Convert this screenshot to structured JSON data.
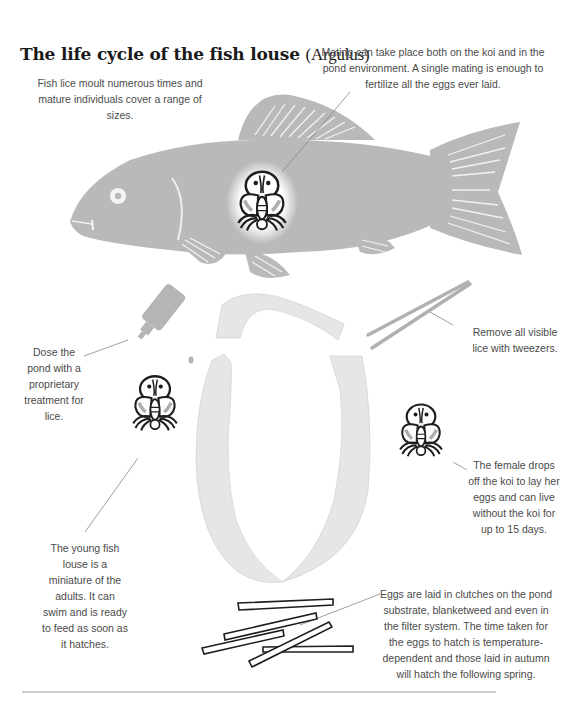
{
  "title": {
    "main": "The life cycle of the fish louse ",
    "latin": "(Argulus)"
  },
  "captions": {
    "moult": "Fish lice moult numerous times and mature individuals cover a range of sizes.",
    "mating": "Mating can take place both on the koi and in the pond environment. A single mating is enough to fertilize all the eggs ever laid.",
    "dose": "Dose the pond with a proprietary treatment for lice.",
    "tweezers": "Remove all visible lice with tweezers.",
    "female": "The female drops off the koi to lay her eggs and can live without the koi for up to 15 days.",
    "young": "The young fish louse is a miniature of the adults. It can swim and is ready to feed as soon as it hatches.",
    "eggs": "Eggs are laid in clutches on the pond substrate, blanketweed and even in the filter system. The time taken for the eggs to hatch is temperature-dependent and those laid in autumn will hatch the following spring."
  },
  "icons": {
    "fish": "koi-fish-icon",
    "louse": "fish-louse-icon",
    "bottle": "dropper-bottle-icon",
    "tweezers": "tweezers-icon",
    "eggs": "egg-clutch-icon",
    "cycle": "cycle-ribbon-icon"
  },
  "colors": {
    "fish": "#b9b9b9",
    "ribbon": "#e6e6e6",
    "ink": "#1e1e1e",
    "text": "#4a4a4a",
    "rule": "#cfcfcf"
  }
}
